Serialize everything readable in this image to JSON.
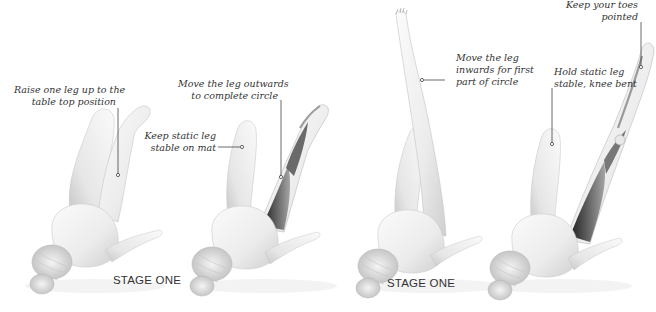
{
  "panels": [
    {
      "id": "panel-1",
      "annotations": [
        {
          "lines": [
            "Raise one leg up to the",
            "table top position"
          ]
        }
      ]
    },
    {
      "id": "panel-2",
      "annotations": [
        {
          "lines": [
            "Move the leg outwards",
            "to complete circle"
          ]
        },
        {
          "lines": [
            "Keep static leg",
            "stable on mat"
          ]
        }
      ]
    },
    {
      "id": "panel-3",
      "annotations": [
        {
          "lines": [
            "Move the leg",
            "inwards for first",
            "part of circle"
          ]
        }
      ]
    },
    {
      "id": "panel-4",
      "annotations": [
        {
          "lines": [
            "Keep your toes",
            "pointed"
          ]
        },
        {
          "lines": [
            "Hold static leg",
            "stable, knee bent"
          ]
        }
      ]
    }
  ],
  "stage_labels": [
    "STAGE ONE",
    "STAGE ONE"
  ],
  "colors": {
    "background": "#ffffff",
    "body_fill": "#f2f2f2",
    "body_shade": "#d6d6d6",
    "muscle_dark": "#3a3a3a",
    "muscle_mid": "#8a8a8a",
    "text": "#333333",
    "leader_line": "#444444"
  }
}
